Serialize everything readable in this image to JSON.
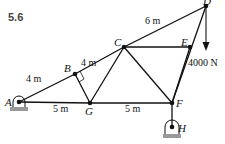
{
  "figure": {
    "problem_number": "5.6",
    "joints": {
      "A": "A",
      "B": "B",
      "C": "C",
      "D": "D",
      "E": "E",
      "F": "F",
      "G": "G",
      "H": "H"
    },
    "dimensions": {
      "AB": "4 m",
      "BC": "4 m",
      "CD": "6 m",
      "AG": "5 m",
      "GF": "5 m"
    },
    "load": {
      "label": "4000 N",
      "joint": "D",
      "direction": "down"
    },
    "supports": {
      "A": "pin",
      "H": "pin"
    },
    "members": [
      "AB",
      "BC",
      "CD",
      "AG",
      "GF",
      "BG",
      "CG",
      "CF",
      "CE",
      "EF",
      "DE",
      "FH"
    ],
    "colors": {
      "line": "#111111",
      "ground": "#999999"
    }
  }
}
